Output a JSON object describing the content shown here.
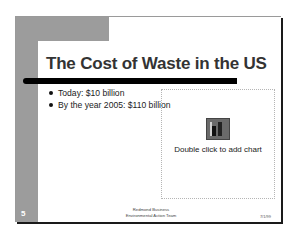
{
  "slide": {
    "title": "The Cost of Waste in the US",
    "bullets": [
      {
        "text": "Today: $10 billion"
      },
      {
        "text": "By the year 2005: $110 billion"
      }
    ],
    "chart_placeholder": {
      "icon": "chart-icon",
      "label": "Double click to add chart"
    },
    "slide_number": "5",
    "footer": {
      "line1": "Redmond Business",
      "line2": "Environmental Action Team"
    },
    "date": "7/1/99"
  }
}
